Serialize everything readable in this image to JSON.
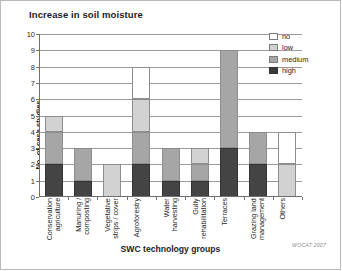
{
  "chart_data": {
    "type": "bar",
    "stacked": true,
    "title": "Increase in soil moisture",
    "xlabel": "SWC technology groups",
    "ylabel": "No. of case studies",
    "ylim": [
      0,
      10
    ],
    "ytick_step": 1,
    "yticks": [
      "0",
      "1",
      "2",
      "3",
      "4",
      "5",
      "6",
      "7",
      "8",
      "9",
      "10"
    ],
    "grid": true,
    "legend_position": "top-right",
    "categories": [
      "Conservation\nagriculture",
      "Manuring /\ncomposting",
      "Vegetative\nstrips / cover",
      "Agroforestry",
      "Water\nharvesting",
      "Gully\nrehabilitation",
      "Terraces",
      "Grazing land\nmanagement",
      "Others"
    ],
    "series": [
      {
        "name": "high",
        "color": "#444444",
        "values": [
          2,
          1,
          0,
          2,
          1,
          1,
          3,
          2,
          0
        ]
      },
      {
        "name": "medium",
        "color": "#a6a6a6",
        "values": [
          2,
          2,
          0,
          2,
          2,
          1,
          6,
          2,
          0
        ]
      },
      {
        "name": "low",
        "color": "#d2d2d2",
        "values": [
          1,
          0,
          2,
          2,
          0,
          1,
          0,
          0,
          2
        ]
      },
      {
        "name": "no",
        "color": "#ffffff",
        "values": [
          0,
          0,
          0,
          2,
          0,
          0,
          0,
          0,
          2
        ]
      }
    ],
    "totals": [
      5,
      3,
      2,
      8,
      3,
      3,
      9,
      4,
      4
    ],
    "legend": [
      {
        "label": "no",
        "color": "#ffffff"
      },
      {
        "label": "low",
        "color": "#d2d2d2"
      },
      {
        "label": "medium",
        "color": "#a6a6a6"
      },
      {
        "label": "high",
        "color": "#3a3a3a"
      }
    ],
    "credit": "WOCAT 2007"
  }
}
